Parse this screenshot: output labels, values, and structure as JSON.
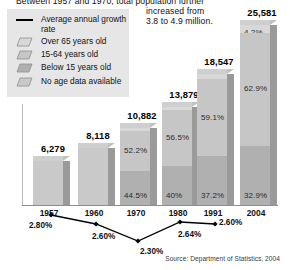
{
  "intro": {
    "line1": "Between 1957 and 1970, total population further",
    "line2": "increased from",
    "line3": "3.8 to 4.9 million."
  },
  "legend": {
    "items": [
      {
        "icon": "line-swatch",
        "label": "Average annual growth rate",
        "color": "#000000"
      },
      {
        "icon": "box-swatch",
        "label": "Over 65 years old",
        "color": "#d8d8d8"
      },
      {
        "icon": "box-swatch",
        "label": "15-64 years old",
        "color": "#c6c6c6"
      },
      {
        "icon": "box-swatch",
        "label": "Below 15 years old",
        "color": "#b0b0b0"
      },
      {
        "icon": "box-swatch",
        "label": "No age data available",
        "color": "#c9c9c9"
      }
    ]
  },
  "source": "Source: Department of Statistics, 2004",
  "chart_data": {
    "type": "bar",
    "title": "",
    "xlabel": "",
    "ylabel": "",
    "categories": [
      "1957",
      "1960",
      "1970",
      "1980",
      "1991",
      "2004"
    ],
    "totals": [
      6279,
      8118,
      10882,
      13879,
      18547,
      25581
    ],
    "total_labels": [
      "6,279",
      "8,118",
      "10,882",
      "13,879",
      "18,547",
      "25,581"
    ],
    "stacked": true,
    "segments": [
      {
        "name": "Over 65 years old",
        "labels": [
          "",
          "",
          "3.3%",
          "3.5%",
          "3.7%",
          "4.2%"
        ],
        "values": [
          null,
          null,
          3.3,
          3.5,
          3.7,
          4.2
        ],
        "color": "#d8d8d8"
      },
      {
        "name": "15-64 years old",
        "labels": [
          "",
          "",
          "52.2%",
          "56.5%",
          "59.1%",
          "62.9%"
        ],
        "values": [
          null,
          null,
          52.2,
          56.5,
          59.1,
          62.9
        ],
        "color": "#c6c6c6"
      },
      {
        "name": "Below 15 years old",
        "labels": [
          "",
          "",
          "44.5%",
          "40%",
          "37.2%",
          "32.9%"
        ],
        "values": [
          null,
          null,
          44.5,
          40.0,
          37.2,
          32.9
        ],
        "color": "#b0b0b0"
      },
      {
        "name": "No age data available",
        "labels": [
          "",
          "",
          "",
          "",
          "",
          ""
        ],
        "values": [
          100,
          100,
          null,
          null,
          null,
          null
        ],
        "color": "#c9c9c9"
      }
    ],
    "line_series": {
      "name": "Average annual growth rate",
      "x": [
        "1957",
        "1960",
        "1970",
        "1980",
        "1991"
      ],
      "values": [
        2.8,
        2.6,
        2.3,
        2.64,
        2.6
      ],
      "labels": [
        "2.80%",
        "2.60%",
        "2.30%",
        "2.64%",
        "2.60%"
      ],
      "marker": "diamond",
      "color": "#000000"
    },
    "grid": false,
    "legend_position": "top-left"
  }
}
